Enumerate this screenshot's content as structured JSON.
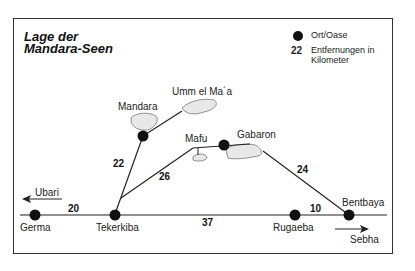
{
  "title": {
    "line1": "Lage der",
    "line2": "Mandara-Seen"
  },
  "legend": {
    "place_symbol_label": "Ort/Oase",
    "distance_sample": "22",
    "distance_label": "Entfernungen in Kilometer"
  },
  "places": {
    "germa": "Germa",
    "tekerkiba": "Tekerkiba",
    "rugaeba": "Rugaeba",
    "bentbaya": "Bentbaya",
    "mandara": "Mandara",
    "umm_el_maa": "Umm el Ma´a",
    "mafu": "Mafu",
    "gabaron": "Gabaron"
  },
  "directions": {
    "west": "Ubari",
    "east": "Sebha"
  },
  "distances": {
    "germa_tekerkiba": "20",
    "tekerkiba_rugaeba": "37",
    "rugaeba_bentbaya": "10",
    "tekerkiba_mandara": "22",
    "tekerkiba_mafu": "26",
    "gabaron_bentbaya": "24"
  }
}
